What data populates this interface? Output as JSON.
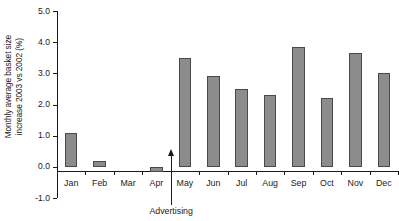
{
  "chart_data": {
    "type": "bar",
    "title": "",
    "subtitle": "",
    "xlabel": "",
    "ylabel_line1": "Monthly average basket size",
    "ylabel_line2": "increase 2003 vs 2002 (%)",
    "categories": [
      "Jan",
      "Feb",
      "Mar",
      "Apr",
      "May",
      "Jun",
      "Jul",
      "Aug",
      "Sep",
      "Oct",
      "Nov",
      "Dec"
    ],
    "values": [
      1.1,
      0.2,
      0.0,
      -0.15,
      3.5,
      2.9,
      2.5,
      2.3,
      3.85,
      2.2,
      3.65,
      3.0
    ],
    "ylim": [
      -1.0,
      5.0
    ],
    "ytick_labels": [
      "5.0",
      "4.0",
      "3.0",
      "2.0",
      "1.0",
      "0.0",
      "-1.0"
    ],
    "ytick_values": [
      5.0,
      4.0,
      3.0,
      2.0,
      1.0,
      0.0,
      -1.0
    ],
    "grid": false,
    "legend": false,
    "bar_color": "#8c8c8c",
    "bar_edge_color": "#4a4a4a",
    "background_color": "#ffffff",
    "axis_color": "#1a1a1a",
    "annotations": [
      {
        "label": "Advertising",
        "at_category_boundary": "Apr/May",
        "arrow_direction": "up",
        "arrow_tip_value": 0.35
      }
    ]
  },
  "caption": {
    "sliver_text": ""
  }
}
